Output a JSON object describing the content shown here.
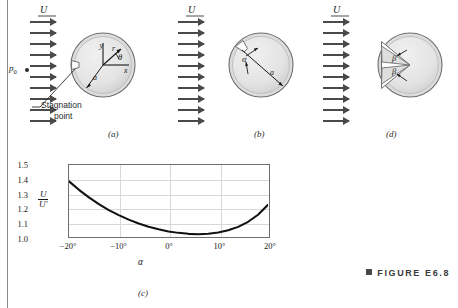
{
  "figure": {
    "caption_label": "FIGURE",
    "caption_number": "E6.8",
    "caption_marker": "square-bullet"
  },
  "panels": [
    {
      "id": "a",
      "label": "(a)",
      "flow_label": "U",
      "pressure_label": "p",
      "pressure_sub": "0",
      "annotation": "Stagnation\npoint",
      "annotation_line1": "Stagnation",
      "annotation_line2": "point",
      "sphere_labels": {
        "axis_y": "y",
        "axis_x": "x",
        "radius_vector": "r",
        "angle": "θ",
        "radius": "a"
      },
      "arrow_count": 10
    },
    {
      "id": "b",
      "label": "(b)",
      "flow_label": "U",
      "sphere_labels": {
        "angle": "α",
        "radius": "a"
      },
      "arrow_count": 10
    },
    {
      "id": "c",
      "label": "(c)"
    },
    {
      "id": "d",
      "label": "(d)",
      "flow_label": "U",
      "sphere_labels": {
        "angle_upper": "β",
        "angle_lower": "β"
      },
      "arrow_count": 10
    }
  ],
  "chart_data": {
    "type": "line",
    "title": "",
    "subtitle": "",
    "xlabel": "α",
    "ylabel": "U/U'",
    "ylabel_numerator": "U",
    "ylabel_denominator": "U'",
    "xlim": [
      -20,
      20
    ],
    "ylim": [
      1.0,
      1.5
    ],
    "grid": true,
    "legend": "none",
    "xtick_labels": [
      "−20°",
      "−10°",
      "0°",
      "10°",
      "20°"
    ],
    "xtick_values": [
      -20,
      -10,
      0,
      10,
      20
    ],
    "ytick_labels": [
      "1.0",
      "1.1",
      "1.2",
      "1.3",
      "1.4",
      "1.5"
    ],
    "ytick_values": [
      1.0,
      1.1,
      1.2,
      1.3,
      1.4,
      1.5
    ],
    "series": [
      {
        "name": "U/U'",
        "x": [
          -20,
          -18,
          -16,
          -14,
          -12,
          -10,
          -8,
          -6,
          -4,
          -2,
          0,
          2,
          4,
          6,
          8,
          10,
          12,
          14,
          16,
          18,
          20
        ],
        "values": [
          1.385,
          1.325,
          1.272,
          1.225,
          1.183,
          1.147,
          1.115,
          1.088,
          1.065,
          1.047,
          1.032,
          1.022,
          1.015,
          1.013,
          1.016,
          1.024,
          1.04,
          1.064,
          1.1,
          1.15,
          1.22
        ]
      }
    ]
  },
  "colors": {
    "sphere_fill": "#e2e2e2",
    "sphere_ring": "#c9c9c9",
    "outline": "#6e6e6e",
    "arrow": "#4a4a4a",
    "curve": "#1a1a1a",
    "grid": "#d8d8d8",
    "rule": "#8a8a8a"
  }
}
